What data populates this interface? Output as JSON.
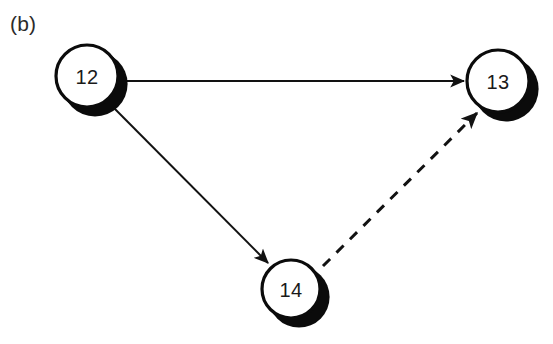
{
  "figure": {
    "panel_label": "(b)",
    "background_color": "#ffffff",
    "ink_color": "#121212",
    "width": 553,
    "height": 344
  },
  "graph": {
    "type": "directed-graph",
    "nodes": [
      {
        "id": "n12",
        "label": "12",
        "cx": 87,
        "cy": 76,
        "r": 31,
        "stroke_width": 3.2,
        "shadow_dx": 8,
        "shadow_dy": 8,
        "fill": "#ffffff",
        "stroke": "#0b0b0b"
      },
      {
        "id": "n13",
        "label": "13",
        "cx": 498,
        "cy": 81,
        "r": 31,
        "stroke_width": 3.2,
        "shadow_dx": 8,
        "shadow_dy": 8,
        "fill": "#ffffff",
        "stroke": "#0b0b0b"
      },
      {
        "id": "n14",
        "label": "14",
        "cx": 291,
        "cy": 289,
        "r": 29,
        "stroke_width": 3.2,
        "shadow_dx": 8,
        "shadow_dy": 8,
        "fill": "#ffffff",
        "stroke": "#0b0b0b"
      }
    ],
    "edges": [
      {
        "id": "e12-13",
        "from": "12",
        "to": "13",
        "style": "solid",
        "directed": true,
        "stroke_width": 2.0,
        "x1": 120,
        "y1": 81,
        "x2": 464,
        "y2": 81
      },
      {
        "id": "e12-14",
        "from": "12",
        "to": "14",
        "style": "solid",
        "directed": true,
        "stroke_width": 2.0,
        "x1": 110,
        "y1": 104,
        "x2": 268,
        "y2": 263
      },
      {
        "id": "e14-13",
        "from": "14",
        "to": "13",
        "style": "dashed",
        "directed": true,
        "stroke_width": 3.0,
        "dash_on": 10,
        "dash_off": 9,
        "x1": 323,
        "y1": 266,
        "x2": 477,
        "y2": 113
      }
    ]
  }
}
